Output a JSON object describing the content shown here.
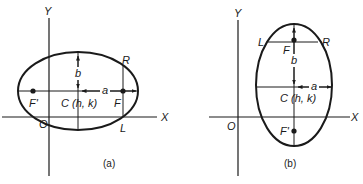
{
  "panels": [
    {
      "id": "a",
      "caption": "(a)",
      "axis_x_label": "X",
      "axis_y_label": "Y",
      "origin_label": "O",
      "center_label": "C (h, k)",
      "focus_label": "F",
      "focus2_label": "F'",
      "latus_top_label": "R",
      "latus_bottom_label": "L",
      "semi_major_label": "a",
      "semi_minor_label": "b",
      "orientation": "horizontal major axis"
    },
    {
      "id": "b",
      "caption": "(b)",
      "axis_x_label": "X",
      "axis_y_label": "Y",
      "origin_label": "O",
      "center_label": "C (h, k)",
      "focus_label": "F",
      "focus2_label": "F'",
      "latus_left_label": "L",
      "latus_right_label": "R",
      "semi_major_label": "b",
      "semi_minor_label": "a",
      "orientation": "vertical major axis"
    }
  ],
  "colors": {
    "stroke": "#1a1a1a",
    "background": "#ffffff"
  }
}
